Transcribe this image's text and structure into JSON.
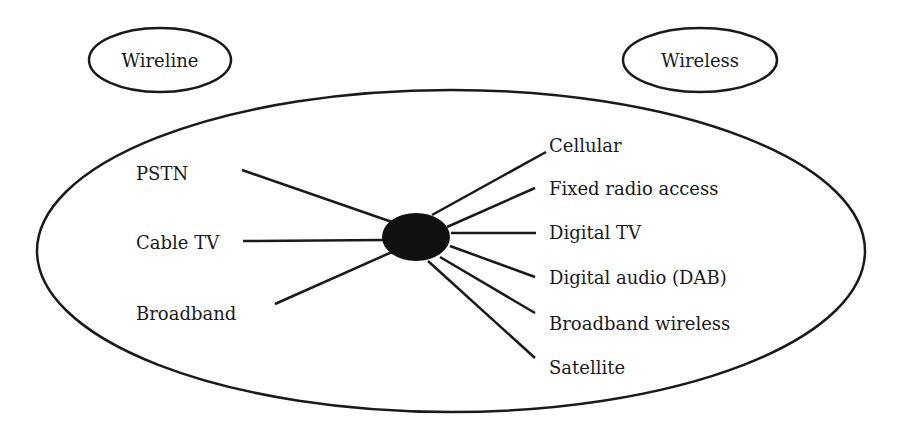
{
  "diagram": {
    "type": "hub-and-spoke",
    "categories": {
      "wireline": {
        "label": "Wireline"
      },
      "wireless": {
        "label": "Wireless"
      }
    },
    "hub": {
      "label": ""
    },
    "wireline_networks": [
      {
        "label": "PSTN"
      },
      {
        "label": "Cable TV"
      },
      {
        "label": "Broadband"
      }
    ],
    "wireless_networks": [
      {
        "label": "Cellular"
      },
      {
        "label": "Fixed radio access"
      },
      {
        "label": "Digital TV"
      },
      {
        "label": "Digital audio (DAB)"
      },
      {
        "label": "Broadband wireless"
      },
      {
        "label": "Satellite"
      }
    ],
    "colors": {
      "ink": "#1a1a1a",
      "background": "#ffffff"
    }
  }
}
